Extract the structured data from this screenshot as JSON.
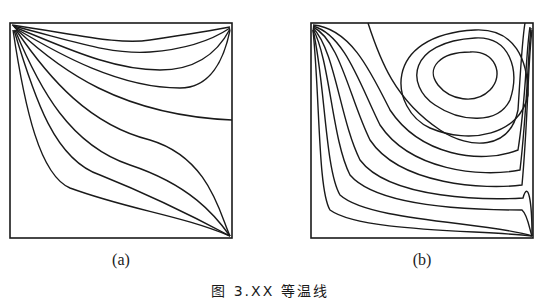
{
  "figure": {
    "caption": "图 3.XX  等温线",
    "panels": [
      {
        "id": "a",
        "label": "(a)",
        "description": "Isotherms in square cavity fanning from top-left corner to bottom-right corner"
      },
      {
        "id": "b",
        "label": "(b)",
        "description": "Isotherms with closed recirculation loops in upper-right region"
      }
    ]
  }
}
